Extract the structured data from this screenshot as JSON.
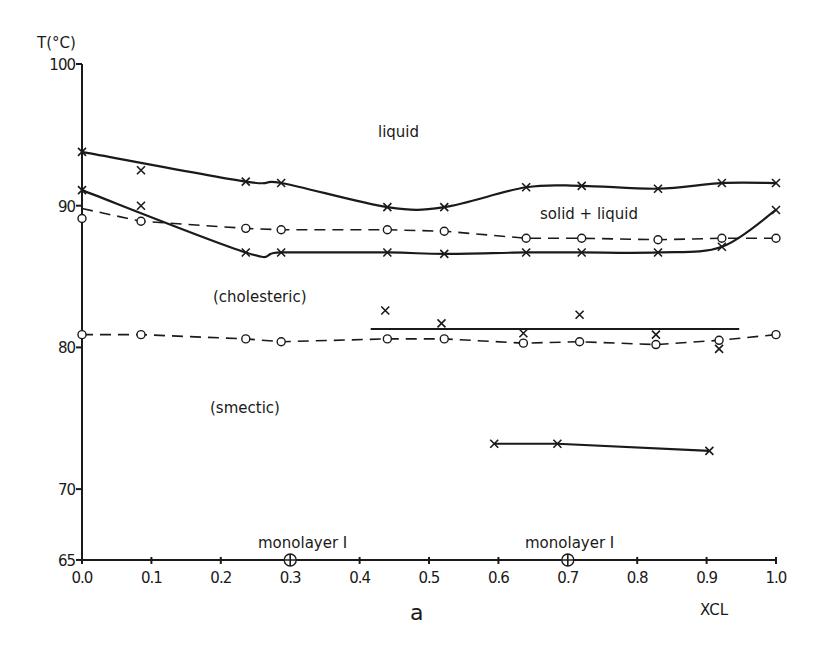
{
  "chart_data": {
    "type": "line",
    "title": "",
    "panel_label": "a",
    "xlabel": "XCL",
    "ylabel": "T(°C)",
    "xlim": [
      0.0,
      1.0
    ],
    "ylim": [
      65,
      100
    ],
    "grid": false,
    "legend": null,
    "x_ticks": [
      "0.0",
      "0.1",
      "0.2",
      "0.3",
      "0.4",
      "0.5",
      "0.6",
      "0.7",
      "0.8",
      "0.9",
      "1.0"
    ],
    "y_ticks": [
      {
        "value": 100,
        "label": "100"
      },
      {
        "value": 90,
        "label": "90"
      },
      {
        "value": 80,
        "label": "80"
      },
      {
        "value": 70,
        "label": "70"
      },
      {
        "value": 65,
        "label": "65"
      }
    ],
    "series": [
      {
        "name": "liquidus (upper solid curve)",
        "style": "solid-smooth",
        "marker": "x",
        "points": [
          [
            0.0,
            93.8
          ],
          [
            0.236,
            91.7
          ],
          [
            0.287,
            91.6
          ],
          [
            0.44,
            89.9
          ],
          [
            0.522,
            89.9
          ],
          [
            0.64,
            91.3
          ],
          [
            0.72,
            91.4
          ],
          [
            0.83,
            91.2
          ],
          [
            0.922,
            91.6
          ],
          [
            1.0,
            91.6
          ]
        ]
      },
      {
        "name": "solidus (lower solid curve)",
        "style": "solid-smooth",
        "marker": "x",
        "points": [
          [
            0.0,
            91.1
          ],
          [
            0.236,
            86.7
          ],
          [
            0.287,
            86.7
          ],
          [
            0.44,
            86.7
          ],
          [
            0.522,
            86.6
          ],
          [
            0.64,
            86.7
          ],
          [
            0.72,
            86.7
          ],
          [
            0.83,
            86.7
          ],
          [
            0.922,
            87.1
          ],
          [
            1.0,
            89.7
          ]
        ]
      },
      {
        "name": "upper dashed transition",
        "style": "dashed",
        "marker": "none",
        "points": [
          [
            0.0,
            89.8
          ],
          [
            0.085,
            88.9
          ],
          [
            0.236,
            88.4
          ],
          [
            0.287,
            88.3
          ],
          [
            0.44,
            88.3
          ],
          [
            0.522,
            88.2
          ],
          [
            0.64,
            87.7
          ],
          [
            0.72,
            87.7
          ],
          [
            0.83,
            87.6
          ],
          [
            0.922,
            87.7
          ],
          [
            1.0,
            87.7
          ]
        ]
      },
      {
        "name": "upper dashed transition points",
        "style": "none",
        "marker": "o",
        "points": [
          [
            0.0,
            89.1
          ],
          [
            0.085,
            88.9
          ],
          [
            0.236,
            88.4
          ],
          [
            0.287,
            88.3
          ],
          [
            0.44,
            88.3
          ],
          [
            0.522,
            88.2
          ],
          [
            0.64,
            87.7
          ],
          [
            0.72,
            87.7
          ],
          [
            0.83,
            87.6
          ],
          [
            0.922,
            87.7
          ],
          [
            1.0,
            87.7
          ]
        ]
      },
      {
        "name": "cholesteric-smectic transition (dashed)",
        "style": "dashed",
        "marker": "o",
        "points": [
          [
            0.0,
            80.9
          ],
          [
            0.085,
            80.9
          ],
          [
            0.236,
            80.6
          ],
          [
            0.287,
            80.4
          ],
          [
            0.44,
            80.6
          ],
          [
            0.522,
            80.6
          ],
          [
            0.636,
            80.3
          ],
          [
            0.717,
            80.4
          ],
          [
            0.827,
            80.2
          ],
          [
            0.918,
            80.5
          ],
          [
            1.0,
            80.9
          ]
        ]
      },
      {
        "name": "horizontal line ~81.3",
        "style": "solid",
        "marker": "none",
        "points": [
          [
            0.416,
            81.3
          ],
          [
            0.947,
            81.3
          ]
        ]
      },
      {
        "name": "points near 81",
        "style": "none",
        "marker": "x",
        "points": [
          [
            0.437,
            82.6
          ],
          [
            0.518,
            81.7
          ],
          [
            0.636,
            81.0
          ],
          [
            0.717,
            82.3
          ],
          [
            0.827,
            80.9
          ],
          [
            0.918,
            79.9
          ]
        ]
      },
      {
        "name": "horizontal line ~73",
        "style": "solid",
        "marker": "x",
        "points": [
          [
            0.594,
            73.2
          ],
          [
            0.685,
            73.2
          ],
          [
            0.904,
            72.7
          ]
        ]
      },
      {
        "name": "isolated points",
        "style": "none",
        "marker": "x",
        "points": [
          [
            0.085,
            92.5
          ],
          [
            0.085,
            90.0
          ]
        ]
      },
      {
        "name": "monolayer I",
        "style": "none",
        "marker": "circled-plus",
        "points": [
          [
            0.3,
            65
          ],
          [
            0.7,
            65
          ]
        ]
      }
    ],
    "annotations": {
      "liquid": "liquid",
      "solid_liquid": "solid + liquid",
      "cholesteric": "(cholesteric)",
      "smectic": "(smectic)",
      "monolayer_left": "monolayer I",
      "monolayer_right": "monolayer I"
    }
  }
}
